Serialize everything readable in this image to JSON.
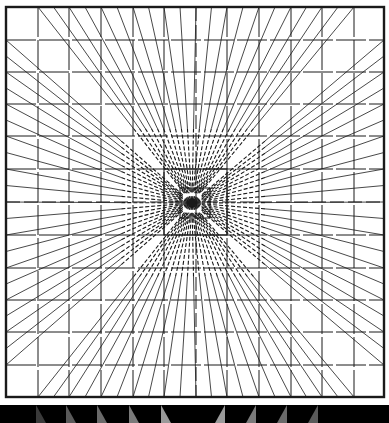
{
  "figure": {
    "background": "#ffffff",
    "ink": "#1a1a1a",
    "frame": {
      "x1": 6,
      "y1": 7,
      "x2": 384,
      "y2": 397,
      "stroke_width": 2.4
    },
    "center": {
      "x": 192,
      "y": 203
    },
    "vertical_lines_x": [
      38,
      69,
      101,
      133,
      164,
      196,
      227,
      259,
      291,
      322,
      354
    ],
    "horizontal_lines_y": [
      40,
      72,
      104,
      136,
      169,
      202,
      235,
      268,
      300,
      332,
      365
    ],
    "dashed_vertical_x": 196,
    "dashed_horizontal_y": 202,
    "inner_squares": [
      {
        "x1": 164,
        "y1": 169,
        "x2": 227,
        "y2": 235
      },
      {
        "x1": 180,
        "y1": 188,
        "x2": 210,
        "y2": 218
      }
    ],
    "bottom_band": {
      "y": 405,
      "height": 18,
      "color": "#000000",
      "wedges": [
        {
          "x": 36,
          "dir": "left",
          "shade": "#3a3a3a"
        },
        {
          "x": 66,
          "dir": "left",
          "shade": "#5a5a5a"
        },
        {
          "x": 97,
          "dir": "left",
          "shade": "#6a6a6a"
        },
        {
          "x": 129,
          "dir": "left",
          "shade": "#7a7a7a"
        },
        {
          "x": 161,
          "dir": "left",
          "shade": "#9a9a9a"
        },
        {
          "x": 225,
          "dir": "right",
          "shade": "#9a9a9a"
        },
        {
          "x": 256,
          "dir": "right",
          "shade": "#7a7a7a"
        },
        {
          "x": 287,
          "dir": "right",
          "shade": "#6a6a6a"
        },
        {
          "x": 318,
          "dir": "right",
          "shade": "#5a5a5a"
        }
      ]
    }
  }
}
